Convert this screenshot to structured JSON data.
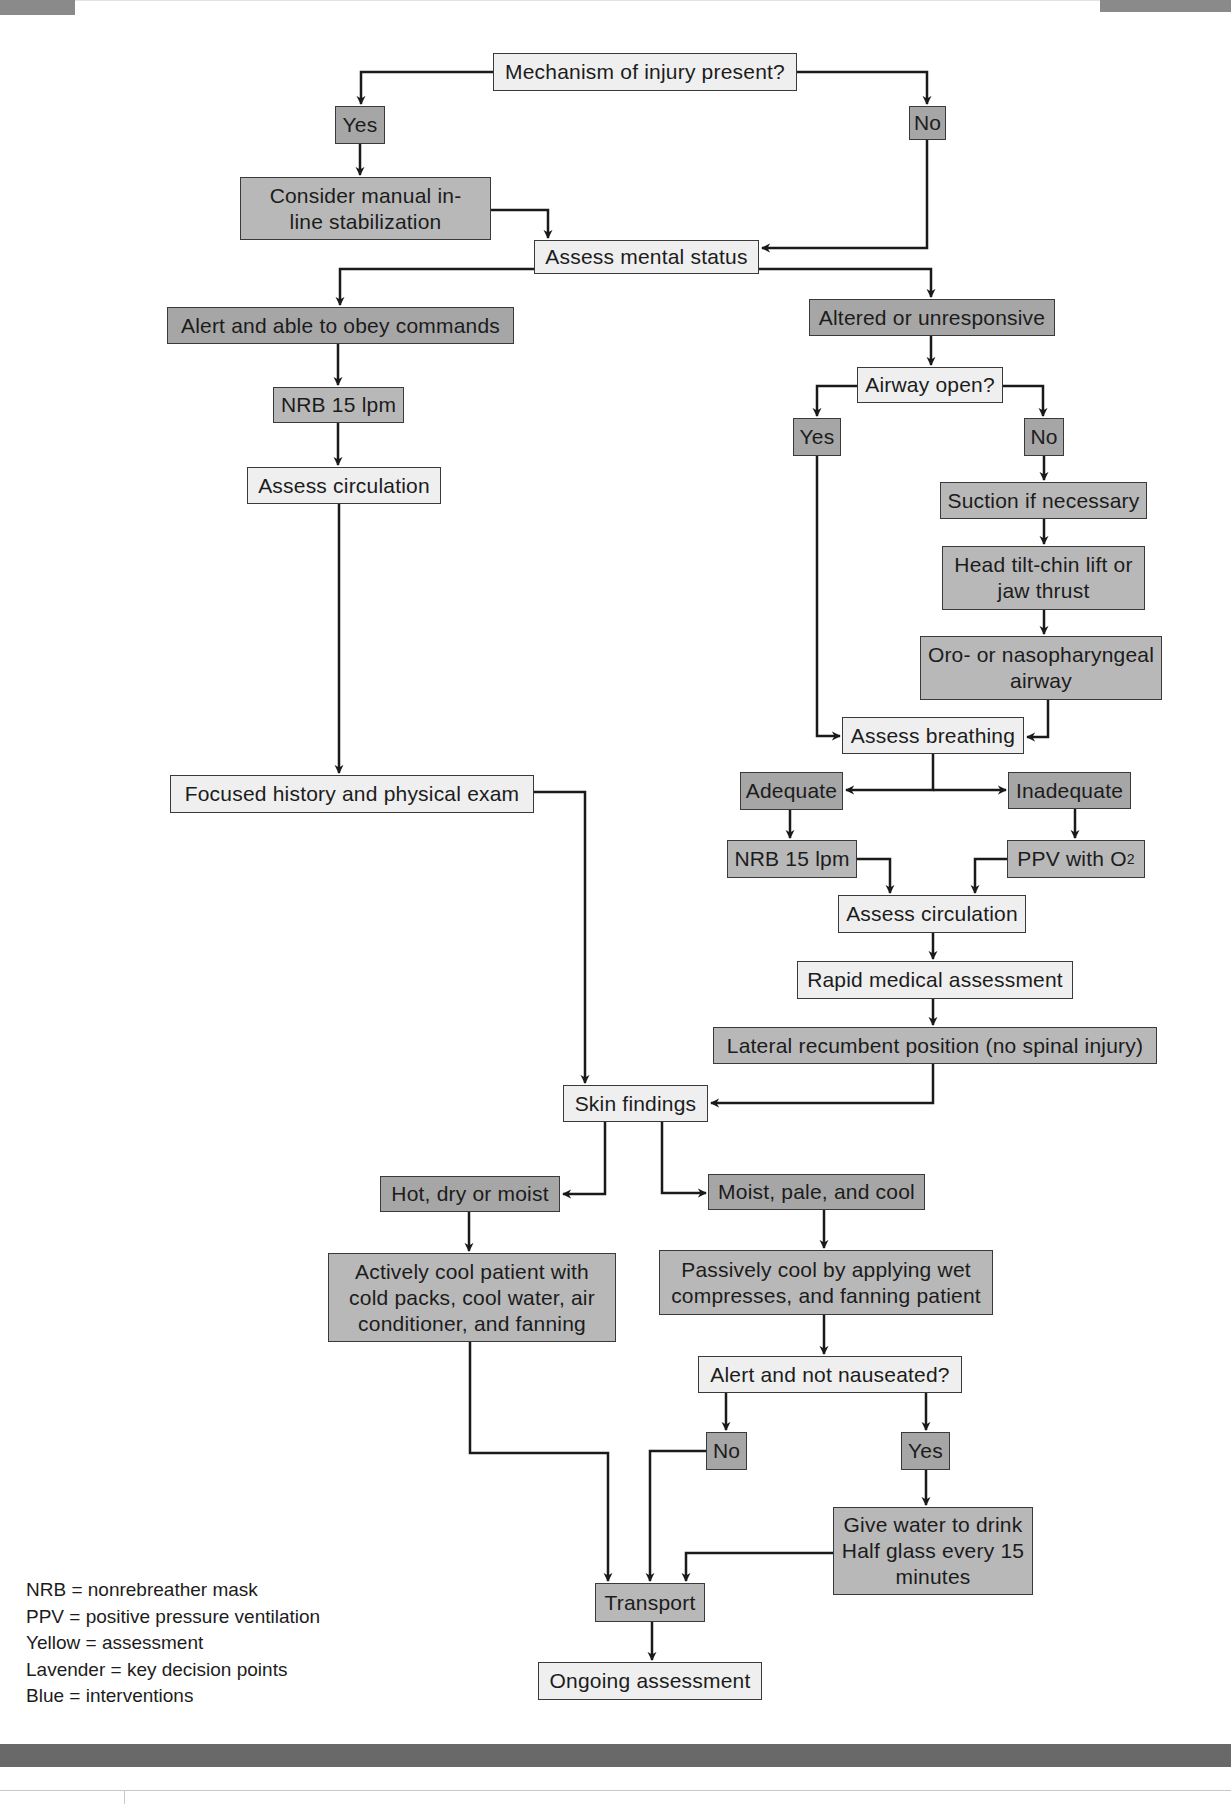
{
  "flowchart": {
    "nodes": {
      "mechanism": "Mechanism of injury present?",
      "mech_yes": "Yes",
      "mech_no": "No",
      "manual_stabilization": "Consider manual in-line stabilization",
      "assess_mental": "Assess mental status",
      "alert_obey": "Alert and able to obey commands",
      "altered": "Altered or unresponsive",
      "nrb_left": "NRB 15 lpm",
      "airway_open": "Airway open?",
      "airway_yes": "Yes",
      "airway_no": "No",
      "assess_circ_left": "Assess circulation",
      "suction": "Suction if necessary",
      "head_tilt": "Head tilt-chin lift or jaw thrust",
      "oro_naso": "Oro- or nasopharyngeal airway",
      "assess_breathing": "Assess breathing",
      "adequate": "Adequate",
      "inadequate": "Inadequate",
      "focused_history": "Focused history and physical exam",
      "nrb_right": "NRB 15 lpm",
      "ppv_main": "PPV with O",
      "ppv_sub": "2",
      "assess_circ_right": "Assess circulation",
      "rapid_medical": "Rapid medical assessment",
      "lateral_recumbent": "Lateral recumbent position (no spinal injury)",
      "skin_findings": "Skin findings",
      "hot_dry": "Hot, dry or moist",
      "moist_pale": "Moist, pale, and cool",
      "actively_cool": "Actively cool patient with cold packs, cool water, air conditioner, and fanning",
      "passively_cool": "Passively cool by applying wet compresses, and fanning patient",
      "alert_not_nauseated": "Alert and not nauseated?",
      "nausea_no": "No",
      "nausea_yes": "Yes",
      "give_water": "Give water to drink Half glass every 15 minutes",
      "transport": "Transport",
      "ongoing": "Ongoing assessment"
    }
  },
  "legend": [
    "NRB = nonrebreather mask",
    "PPV = positive pressure ventilation",
    "Yellow = assessment",
    "Lavender = key decision points",
    "Blue = interventions"
  ],
  "colors": {
    "assessment_fill": "#efefef",
    "decision_fill": "#a6a6a6",
    "intervention_fill": "#b8b8b8",
    "line": "#1a1a1a",
    "band": "#696969"
  }
}
